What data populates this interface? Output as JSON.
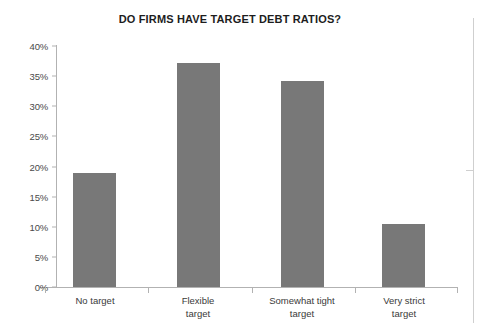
{
  "chart_data": {
    "type": "bar",
    "title": "DO FIRMS HAVE TARGET DEBT RATIOS?",
    "xlabel": "",
    "ylabel": "",
    "categories": [
      "No target",
      "Flexible target",
      "Somewhat tight target",
      "Very strict target"
    ],
    "category_lines": [
      [
        "No target"
      ],
      [
        "Flexible",
        "target"
      ],
      [
        "Somewhat tight",
        "target"
      ],
      [
        "Very strict",
        "target"
      ]
    ],
    "values": [
      19.0,
      37.2,
      34.2,
      10.5
    ],
    "ylim": [
      0,
      40
    ],
    "ytick_values": [
      0,
      5,
      10,
      15,
      20,
      25,
      30,
      35,
      40
    ],
    "ytick_labels": [
      "0%",
      "5%",
      "10%",
      "15%",
      "20%",
      "25%",
      "30%",
      "35%",
      "40%"
    ],
    "grid": false,
    "legend": false,
    "bar_color": "#787878",
    "axis_color": "#b2b2b2",
    "title_color": "#1d1d1d",
    "label_color": "#3a3a3a"
  }
}
